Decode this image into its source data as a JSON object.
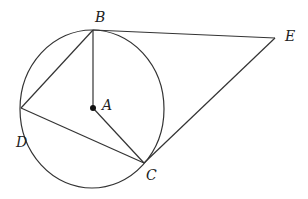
{
  "diagram": {
    "type": "geometry",
    "circle": {
      "center": "A",
      "cx": 92,
      "cy": 109,
      "rx": 72,
      "ry": 79
    },
    "points": {
      "A": {
        "label": "A",
        "x": 93,
        "y": 108
      },
      "B": {
        "label": "B",
        "x": 93,
        "y": 30
      },
      "C": {
        "label": "C",
        "x": 144,
        "y": 163
      },
      "D": {
        "label": "D",
        "x": 21,
        "y": 108
      },
      "E": {
        "label": "E",
        "x": 275,
        "y": 38
      }
    },
    "segments": [
      "AB",
      "AC",
      "BD",
      "DC",
      "BE",
      "CE"
    ],
    "stroke_color": "#333333"
  }
}
